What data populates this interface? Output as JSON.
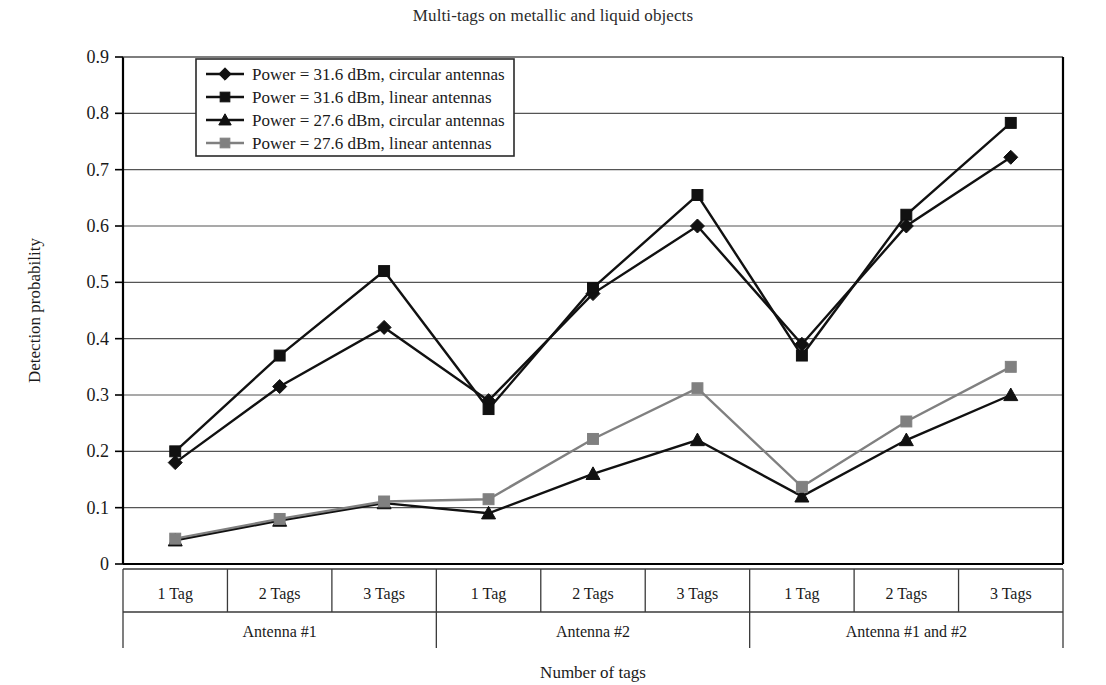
{
  "chart_data": {
    "type": "line",
    "title": "Multi-tags on metallic and liquid objects",
    "xlabel": "Number of tags",
    "ylabel": "Detection probability",
    "ylim": [
      0,
      0.9
    ],
    "yticks": [
      "0",
      "0.1",
      "0.2",
      "0.3",
      "0.4",
      "0.5",
      "0.6",
      "0.7",
      "0.8",
      "0.9"
    ],
    "ytick_values": [
      0,
      0.1,
      0.2,
      0.3,
      0.4,
      0.5,
      0.6,
      0.7,
      0.8,
      0.9
    ],
    "grid": true,
    "legend_position": "top-left inside",
    "categories": [
      "1 Tag",
      "2 Tags",
      "3 Tags",
      "1 Tag",
      "2 Tags",
      "3 Tags",
      "1 Tag",
      "2 Tags",
      "3 Tags"
    ],
    "groups": [
      {
        "label": "Antenna #1",
        "span": 3
      },
      {
        "label": "Antenna #2",
        "span": 3
      },
      {
        "label": "Antenna #1 and #2",
        "span": 3
      }
    ],
    "series": [
      {
        "name": "Power = 31.6 dBm, circular antennas",
        "marker": "diamond",
        "color": "#111111",
        "values": [
          0.18,
          0.315,
          0.42,
          0.29,
          0.48,
          0.6,
          0.39,
          0.6,
          0.722
        ]
      },
      {
        "name": "Power = 31.6 dBm, linear antennas",
        "marker": "square",
        "color": "#111111",
        "values": [
          0.2,
          0.37,
          0.52,
          0.275,
          0.49,
          0.655,
          0.37,
          0.62,
          0.783
        ]
      },
      {
        "name": "Power = 27.6 dBm, circular antennas",
        "marker": "triangle",
        "color": "#111111",
        "values": [
          0.042,
          0.077,
          0.108,
          0.09,
          0.16,
          0.22,
          0.12,
          0.22,
          0.3
        ]
      },
      {
        "name": "Power = 27.6 dBm, linear antennas",
        "marker": "square",
        "color": "#808080",
        "values": [
          0.045,
          0.08,
          0.111,
          0.115,
          0.222,
          0.312,
          0.137,
          0.253,
          0.35
        ]
      }
    ]
  }
}
